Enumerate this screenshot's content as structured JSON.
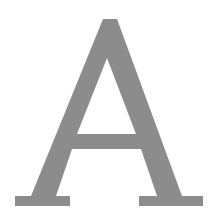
{
  "glyph": {
    "character": "A",
    "style": "serif capital letter",
    "fill_color": "#8c8c8c",
    "background_color": "#ffffff"
  }
}
